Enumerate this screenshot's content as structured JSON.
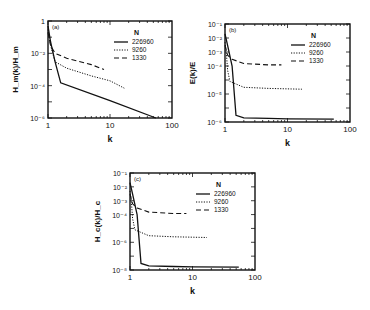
{
  "figure": {
    "panels": [
      {
        "id": "a",
        "panel_label": "(a)",
        "ylabel": "H_m(k)/H_m",
        "xlabel": "k",
        "frame": {
          "x": 48,
          "y": 21,
          "w": 124,
          "h": 97
        },
        "ydecades": [
          -6,
          0
        ],
        "yticklabels": [
          "1",
          "10⁻²",
          "10⁻⁴",
          "10⁻⁶"
        ],
        "ytickvalues": [
          0,
          -2,
          -4,
          -6
        ],
        "xticklabels": [
          "1",
          "10",
          "100"
        ],
        "legend": {
          "title": "N",
          "x_offset": 84,
          "y_offset": 8
        }
      },
      {
        "id": "b",
        "panel_label": "(b)",
        "ylabel": "E(k)/E",
        "xlabel": "k",
        "frame": {
          "x": 225,
          "y": 24,
          "w": 125,
          "h": 98
        },
        "ydecades": [
          -8,
          -1
        ],
        "yticklabels": [
          "10⁻¹",
          "10⁻²",
          "10⁻³",
          "10⁻⁴",
          "10⁻⁵",
          "10⁻⁶"
        ],
        "ytickvalues": [
          -1,
          -2,
          -3,
          -4,
          -6,
          -8
        ],
        "xticklabels": [
          "1",
          "10",
          "100"
        ],
        "legend": {
          "title": "N",
          "x_offset": 84,
          "y_offset": 8
        }
      },
      {
        "id": "c",
        "panel_label": "(c)",
        "ylabel": "H_c(k)/H_c",
        "xlabel": "k",
        "frame": {
          "x": 130,
          "y": 173,
          "w": 125,
          "h": 97
        },
        "ydecades": [
          -8,
          -1
        ],
        "yticklabels": [
          "10⁻¹",
          "10⁻²",
          "10⁻³",
          "10⁻⁴",
          "10⁻⁶",
          "10⁻⁸"
        ],
        "ytickvalues": [
          -1,
          -2,
          -3,
          -4,
          -6,
          -8
        ],
        "xticklabels": [
          "1",
          "10",
          "100"
        ],
        "legend": {
          "title": "N",
          "x_offset": 84,
          "y_offset": 8
        }
      }
    ]
  },
  "chart_data": [
    {
      "type": "line",
      "title": "(a)",
      "xlabel": "k",
      "ylabel": "H_m(k)/H_m",
      "xscale": "log",
      "yscale": "log",
      "xlim": [
        1,
        100
      ],
      "ylim": [
        1e-06,
        1
      ],
      "legend_title": "N",
      "legend_position": "upper right",
      "series": [
        {
          "name": "226960",
          "style": "solid",
          "x": [
            1,
            1.1,
            1.3,
            1.6,
            10,
            55
          ],
          "y": [
            0.5,
            0.05,
            0.003,
            0.00015,
            1.2e-05,
            1e-06
          ]
        },
        {
          "name": "9260",
          "style": "dotted",
          "x": [
            1,
            1.1,
            1.3,
            2,
            5,
            10,
            17
          ],
          "y": [
            0.3,
            0.03,
            0.003,
            0.0012,
            0.0004,
            0.0002,
            7e-05
          ]
        },
        {
          "name": "1330",
          "style": "dashed",
          "x": [
            1,
            1.1,
            1.3,
            2,
            5,
            8
          ],
          "y": [
            0.2,
            0.03,
            0.01,
            0.005,
            0.002,
            0.001
          ]
        }
      ]
    },
    {
      "type": "line",
      "title": "(b)",
      "xlabel": "k",
      "ylabel": "E(k)/E",
      "xscale": "log",
      "yscale": "log",
      "xlim": [
        1,
        100
      ],
      "ylim": [
        1e-08,
        0.1
      ],
      "legend_title": "N",
      "legend_position": "upper right",
      "series": [
        {
          "name": "226960",
          "style": "solid",
          "x": [
            1,
            1.1,
            1.3,
            1.5,
            2,
            5,
            10,
            55
          ],
          "y": [
            0.02,
            0.003,
            0.0001,
            3e-08,
            2e-08,
            1.8e-08,
            1.7e-08,
            1.6e-08
          ]
        },
        {
          "name": "9260",
          "style": "dotted",
          "x": [
            1,
            1.05,
            1.1,
            1.2,
            2,
            5,
            17
          ],
          "y": [
            0.005,
            0.001,
            5e-05,
            8e-06,
            3e-06,
            2.5e-06,
            2.2e-06
          ]
        },
        {
          "name": "1330",
          "style": "dashed",
          "x": [
            1,
            1.1,
            1.3,
            2,
            5,
            8
          ],
          "y": [
            0.003,
            0.0006,
            0.0003,
            0.00015,
            0.00012,
            0.00012
          ]
        }
      ]
    },
    {
      "type": "line",
      "title": "(c)",
      "xlabel": "k",
      "ylabel": "H_c(k)/H_c",
      "xscale": "log",
      "yscale": "log",
      "xlim": [
        1,
        100
      ],
      "ylim": [
        1e-08,
        0.1
      ],
      "legend_title": "N",
      "legend_position": "upper right",
      "series": [
        {
          "name": "226960",
          "style": "solid",
          "x": [
            1,
            1.1,
            1.3,
            1.5,
            2,
            5,
            10,
            55
          ],
          "y": [
            0.02,
            0.003,
            0.0001,
            3e-08,
            2e-08,
            1.8e-08,
            1.7e-08,
            1.6e-08
          ]
        },
        {
          "name": "9260",
          "style": "dotted",
          "x": [
            1,
            1.05,
            1.1,
            1.2,
            2,
            5,
            17
          ],
          "y": [
            0.005,
            0.001,
            5e-05,
            8e-06,
            3e-06,
            2.5e-06,
            2.2e-06
          ]
        },
        {
          "name": "1330",
          "style": "dashed",
          "x": [
            1,
            1.1,
            1.3,
            2,
            5,
            8
          ],
          "y": [
            0.003,
            0.0006,
            0.0003,
            0.00015,
            0.00012,
            0.00012
          ]
        }
      ]
    }
  ]
}
